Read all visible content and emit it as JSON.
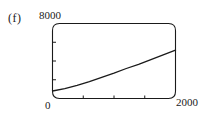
{
  "panel": {
    "label": "(f)"
  },
  "axes": {
    "y_max_label": "8000",
    "y_min_label": "0",
    "x_max_label": "2000"
  },
  "style": {
    "line_color": "#1a1a1a",
    "frame_color": "#1a1a1a",
    "background": "#ffffff"
  },
  "chart_data": {
    "type": "line",
    "title": "(f)",
    "xlabel": "",
    "ylabel": "",
    "xlim": [
      0,
      2000
    ],
    "ylim": [
      0,
      8000
    ],
    "grid": false,
    "legend": null,
    "x_ticks": [
      500,
      1000,
      1500
    ],
    "x_tick_labels": [
      "",
      "",
      ""
    ],
    "y_ticks": [
      2000,
      4000,
      6000
    ],
    "y_tick_labels": [
      "",
      "",
      ""
    ],
    "x_axis_labeled_ends": [
      "0",
      "2000"
    ],
    "y_axis_labeled_ends": [
      "0",
      "8000"
    ],
    "series": [
      {
        "name": "curve",
        "x": [
          0,
          200,
          400,
          600,
          800,
          1000,
          1200,
          1400,
          1600,
          1800,
          2000
        ],
        "y": [
          800,
          1050,
          1400,
          1800,
          2250,
          2700,
          3200,
          3650,
          4150,
          4650,
          5150
        ]
      }
    ]
  }
}
